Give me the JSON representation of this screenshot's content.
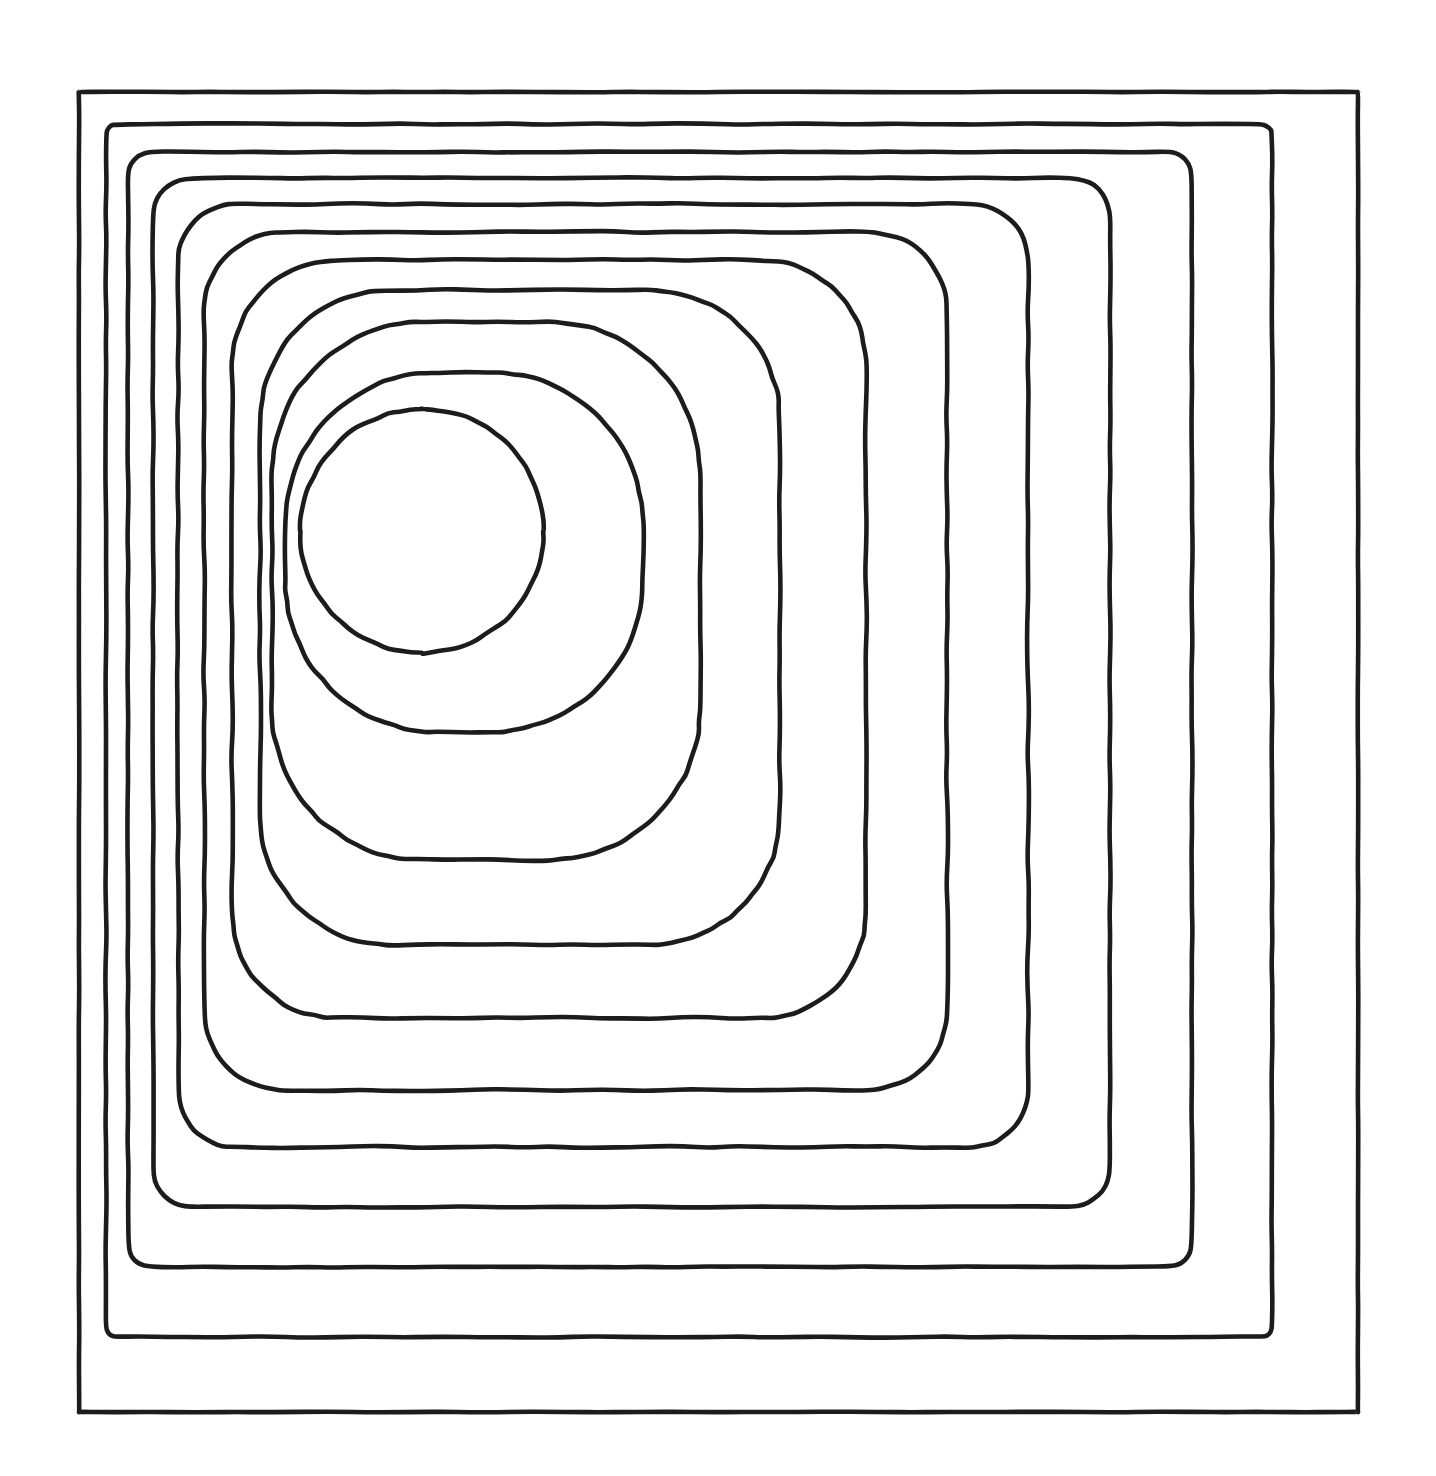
{
  "figure": {
    "type": "contour-plot",
    "title": "",
    "background_color": "#ffffff",
    "line_color": "#1c1c1c",
    "line_width": 4.6,
    "width": 1436,
    "height": 1476,
    "filled": false,
    "labels_shown": false,
    "axes_shown": false,
    "grid_shown": false,
    "legend_shown": false,
    "colorbar_shown": false,
    "level_count": 11
  },
  "chart_data": {
    "type": "line",
    "title": "",
    "subtitle": "",
    "xlabel": "",
    "ylabel": "",
    "xlim": [
      0,
      1436
    ],
    "ylim": [
      0,
      1476
    ],
    "grid": false,
    "legend": "none",
    "peak_center": [
      422,
      531
    ],
    "innermost_radius": 122,
    "levels": [
      {
        "index": 0,
        "name": "level-1-outer-rectangle",
        "shape": "rectangle",
        "corner_radius": 0,
        "bbox": [
          79,
          92,
          1358,
          1412
        ],
        "center": [
          718,
          752
        ]
      },
      {
        "index": 1,
        "name": "level-2",
        "shape": "rounded-rectangle",
        "corner_radius": 10,
        "bbox": [
          106,
          124,
          1272,
          1337
        ],
        "center": [
          689,
          730
        ]
      },
      {
        "index": 2,
        "name": "level-3",
        "shape": "rounded-rectangle",
        "corner_radius": 22,
        "bbox": [
          128,
          152,
          1192,
          1267
        ],
        "center": [
          660,
          709
        ]
      },
      {
        "index": 3,
        "name": "level-4",
        "shape": "rounded-rectangle",
        "corner_radius": 38,
        "bbox": [
          153,
          178,
          1110,
          1207
        ],
        "center": [
          631,
          692
        ]
      },
      {
        "index": 4,
        "name": "level-5",
        "shape": "rounded-rectangle",
        "corner_radius": 56,
        "bbox": [
          178,
          204,
          1028,
          1147
        ],
        "center": [
          603,
          675
        ]
      },
      {
        "index": 5,
        "name": "level-6",
        "shape": "rounded-rectangle",
        "corner_radius": 78,
        "bbox": [
          204,
          232,
          947,
          1090
        ],
        "center": [
          575,
          661
        ]
      },
      {
        "index": 6,
        "name": "level-7",
        "shape": "rounded-rectangle",
        "corner_radius": 104,
        "bbox": [
          232,
          260,
          866,
          1018
        ],
        "center": [
          549,
          639
        ]
      },
      {
        "index": 7,
        "name": "level-8",
        "shape": "rounded-rectangle",
        "corner_radius": 130,
        "bbox": [
          260,
          290,
          780,
          945
        ],
        "center": [
          520,
          617
        ]
      },
      {
        "index": 8,
        "name": "level-9",
        "shape": "rounded-rectangle",
        "corner_radius": 150,
        "bbox": [
          272,
          322,
          700,
          860
        ],
        "center": [
          486,
          591
        ]
      },
      {
        "index": 9,
        "name": "level-10",
        "shape": "rounded-rectangle",
        "corner_radius": 152,
        "bbox": [
          285,
          372,
          643,
          732
        ],
        "center": [
          464,
          552
        ]
      },
      {
        "index": 10,
        "name": "level-11-inner-circle",
        "shape": "circle",
        "corner_radius": 122,
        "bbox": [
          300,
          409,
          544,
          653
        ],
        "center": [
          422,
          531
        ]
      }
    ]
  }
}
